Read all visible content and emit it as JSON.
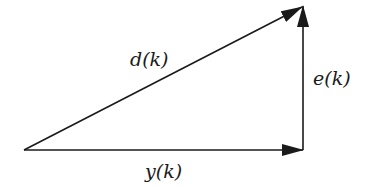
{
  "diagram": {
    "colors": {
      "stroke": "#1a1a1a",
      "background": "#ffffff"
    },
    "vertices": {
      "origin": {
        "x": 24,
        "y": 150
      },
      "corner": {
        "x": 303,
        "y": 150
      },
      "apex": {
        "x": 303,
        "y": 6
      }
    },
    "vectors": [
      {
        "id": "d",
        "label": "d(k)",
        "from": "origin",
        "to": "apex"
      },
      {
        "id": "e",
        "label": "e(k)",
        "from": "corner",
        "to": "apex"
      },
      {
        "id": "y",
        "label": "y(k)",
        "from": "origin",
        "to": "corner"
      }
    ],
    "labels": {
      "d": "d(k)",
      "e": "e(k)",
      "y": "y(k)"
    }
  }
}
